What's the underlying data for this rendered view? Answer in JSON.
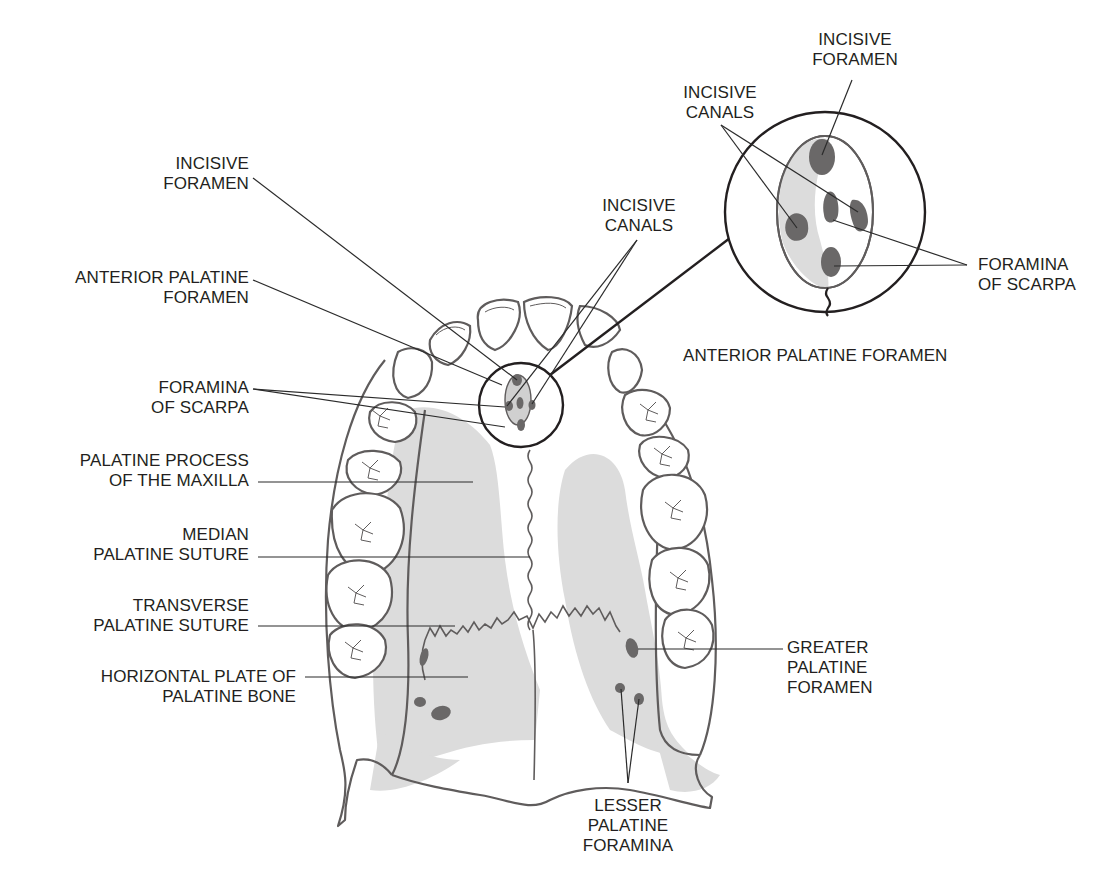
{
  "diagram": {
    "colors": {
      "outline": "#5f5c5c",
      "leader": "#2b2b2b",
      "bone_shade": "#d9d9d9",
      "foramen_fill": "#6a6868",
      "text": "#231f20"
    },
    "left_labels": [
      {
        "id": "incisive-foramen-left",
        "lines": [
          "INCISIVE",
          "FORAMEN"
        ]
      },
      {
        "id": "anterior-palatine-foramen-left",
        "lines": [
          "ANTERIOR PALATINE",
          "FORAMEN"
        ]
      },
      {
        "id": "foramina-of-scarpa-left",
        "lines": [
          "FORAMINA",
          "OF SCARPA"
        ]
      },
      {
        "id": "palatine-process",
        "lines": [
          "PALATINE PROCESS",
          "OF THE MAXILLA"
        ]
      },
      {
        "id": "median-palatine-suture",
        "lines": [
          "MEDIAN",
          "PALATINE SUTURE"
        ]
      },
      {
        "id": "transverse-palatine-suture",
        "lines": [
          "TRANSVERSE",
          "PALATINE SUTURE"
        ]
      },
      {
        "id": "horizontal-plate",
        "lines": [
          "HORIZONTAL PLATE OF",
          "PALATINE BONE"
        ]
      }
    ],
    "center_labels": [
      {
        "id": "incisive-canals-center",
        "lines": [
          "INCISIVE",
          "CANALS"
        ]
      }
    ],
    "inset": {
      "title": "ANTERIOR PALATINE FORAMEN",
      "labels": [
        {
          "id": "incisive-foramen-inset",
          "lines": [
            "INCISIVE",
            "FORAMEN"
          ]
        },
        {
          "id": "incisive-canals-inset",
          "lines": [
            "INCISIVE",
            "CANALS"
          ]
        },
        {
          "id": "foramina-of-scarpa-inset",
          "lines": [
            "FORAMINA",
            "OF SCARPA"
          ]
        }
      ]
    },
    "right_labels": [
      {
        "id": "greater-palatine-foramen",
        "lines": [
          "GREATER",
          "PALATINE",
          "FORAMEN"
        ]
      }
    ],
    "bottom_labels": [
      {
        "id": "lesser-palatine-foramina",
        "lines": [
          "LESSER",
          "PALATINE",
          "FORAMINA"
        ]
      }
    ]
  }
}
